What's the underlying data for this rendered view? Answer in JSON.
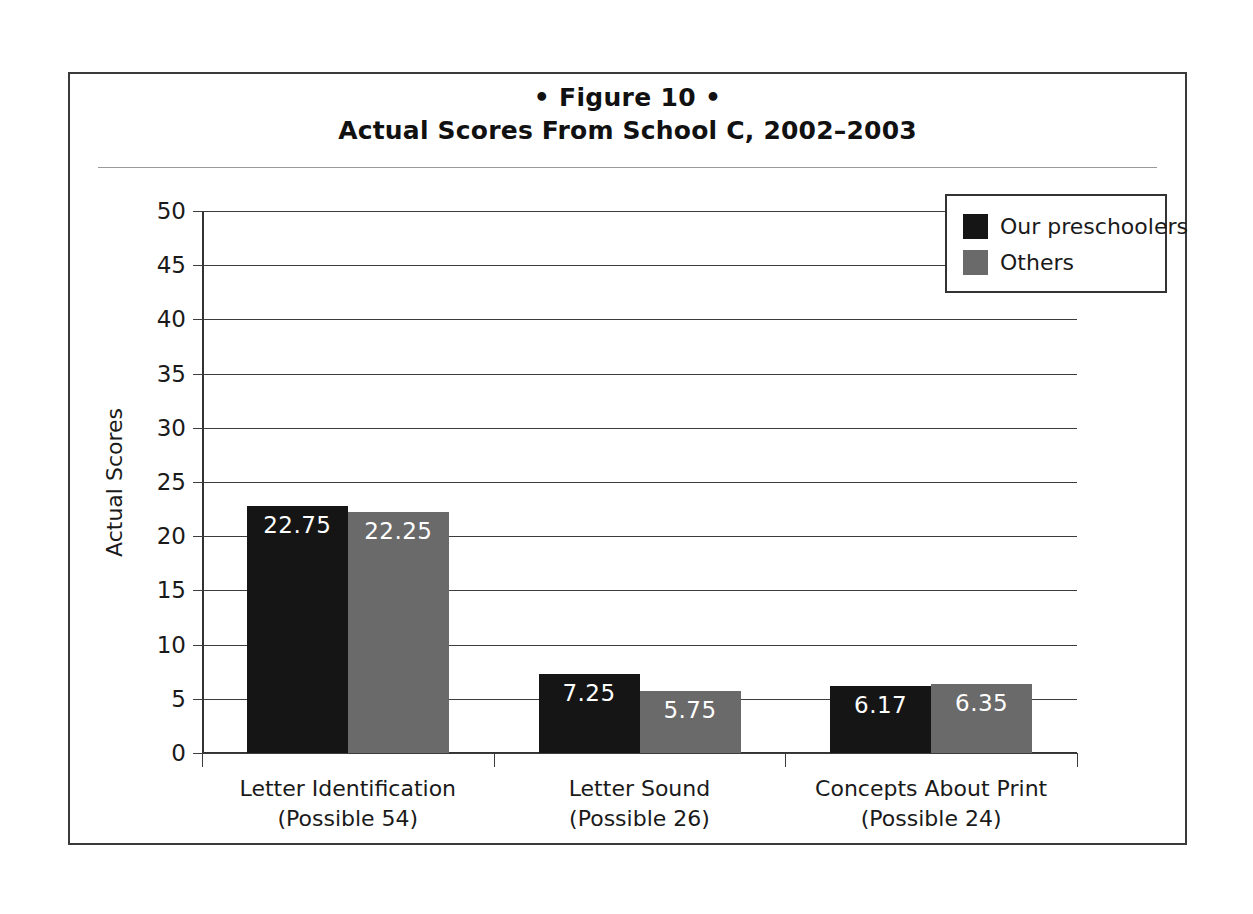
{
  "figure": {
    "number_line": "• Figure 10 •",
    "title": "Actual Scores From School C, 2002–2003"
  },
  "legend": {
    "position": "top-right",
    "entries": [
      {
        "label": "Our preschoolers",
        "color": "#151515"
      },
      {
        "label": "Others",
        "color": "#6a6a6a"
      }
    ]
  },
  "chart_data": {
    "type": "bar",
    "title": "Actual Scores From School C, 2002–2003",
    "subtitle": "• Figure 10 •",
    "xlabel": "",
    "ylabel": "Actual Scores",
    "ylim": [
      0,
      50
    ],
    "ytick_step": 5,
    "yticks": [
      "50",
      "45",
      "40",
      "35",
      "30",
      "25",
      "20",
      "15",
      "10",
      "5",
      "0"
    ],
    "grid": true,
    "grid_axis": "y",
    "legend_position": "top-right",
    "categories": [
      "Letter Identification",
      "Letter Sound",
      "Concepts About Print"
    ],
    "category_sublabels": [
      "(Possible 54)",
      "(Possible 26)",
      "(Possible 24)"
    ],
    "series": [
      {
        "name": "Our preschoolers",
        "color": "#151515",
        "values": [
          22.75,
          7.25,
          6.17
        ],
        "labels": [
          "22.75",
          "7.25",
          "6.17"
        ]
      },
      {
        "name": "Others",
        "color": "#6a6a6a",
        "values": [
          22.25,
          5.75,
          6.35
        ],
        "labels": [
          "22.25",
          "5.75",
          "6.35"
        ]
      }
    ]
  }
}
